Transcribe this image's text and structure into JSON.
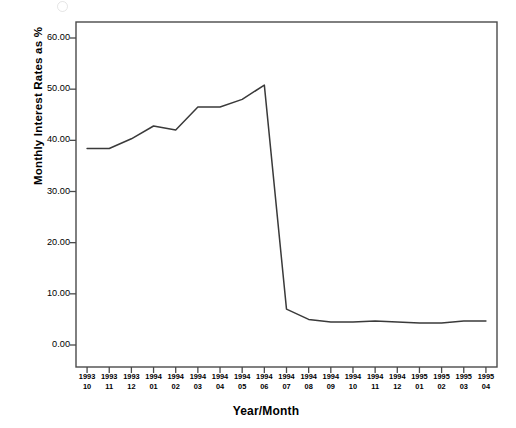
{
  "figure": {
    "background_color": "#ffffff",
    "line_color": "#3a3a3a",
    "axis_color": "#4a4a4a",
    "artifact": "scan-artifact-circle"
  },
  "chart_data": {
    "type": "line",
    "title": "",
    "xlabel": "Year/Month",
    "ylabel": "Monthly Interest Rates as %",
    "ylim": [
      0.0,
      63.0
    ],
    "ytick_values": [
      0.0,
      10.0,
      20.0,
      30.0,
      40.0,
      50.0,
      60.0
    ],
    "ytick_labels": [
      "0.00",
      "10.00",
      "20.00",
      "30.00",
      "40.00",
      "50.00",
      "60.00"
    ],
    "grid": false,
    "legend": false,
    "categories": [
      "1993\n10",
      "1993\n11",
      "1993\n12",
      "1994\n01",
      "1994\n02",
      "1994\n03",
      "1994\n04",
      "1994\n05",
      "1994\n06",
      "1994\n07",
      "1994\n08",
      "1994\n09",
      "1994\n10",
      "1994\n11",
      "1994\n12",
      "1995\n01",
      "1995\n02",
      "1995\n03",
      "1995\n04"
    ],
    "xtick_years": [
      "1993",
      "1993",
      "1993",
      "1994",
      "1994",
      "1994",
      "1994",
      "1994",
      "1994",
      "1994",
      "1994",
      "1994",
      "1994",
      "1994",
      "1994",
      "1995",
      "1995",
      "1995",
      "1995"
    ],
    "xtick_months": [
      "10",
      "11",
      "12",
      "01",
      "02",
      "03",
      "04",
      "05",
      "06",
      "07",
      "08",
      "09",
      "10",
      "11",
      "12",
      "01",
      "02",
      "03",
      "04"
    ],
    "values": [
      38.4,
      38.4,
      40.3,
      42.8,
      42.0,
      46.5,
      46.5,
      48.0,
      50.8,
      7.0,
      5.0,
      4.5,
      4.5,
      4.7,
      4.5,
      4.3,
      4.3,
      4.7,
      4.7
    ],
    "series": [
      {
        "name": "Monthly Interest Rate",
        "values": [
          38.4,
          38.4,
          40.3,
          42.8,
          42.0,
          46.5,
          46.5,
          48.0,
          50.8,
          7.0,
          5.0,
          4.5,
          4.5,
          4.7,
          4.5,
          4.3,
          4.3,
          4.7,
          4.7
        ]
      }
    ]
  }
}
